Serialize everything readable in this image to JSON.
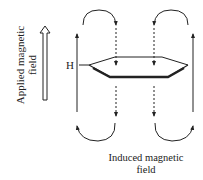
{
  "diagram": {
    "applied_field_label": {
      "line1": "Applied magnetic",
      "line2": "field"
    },
    "induced_field_label": {
      "line1": "Induced magnetic",
      "line2": "field"
    },
    "atom_label": "H",
    "colors": {
      "stroke": "#222222",
      "background": "#ffffff"
    }
  }
}
